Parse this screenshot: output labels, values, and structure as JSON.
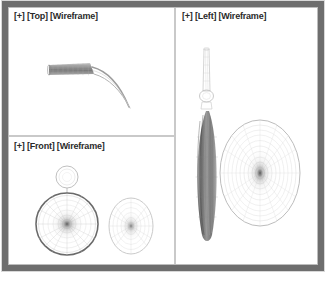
{
  "window": {
    "title": "3D Modeling Viewports",
    "frame_color": "#6e6e6e",
    "background_color": "#ffffff"
  },
  "viewports": [
    {
      "id": "top",
      "label": "[+] [Top] [Wireframe]",
      "label_prefix": "[+]",
      "view_name": "[Top]",
      "shading_mode": "[Wireframe]",
      "objects": "tapered cylinder with curved tail, wireframe"
    },
    {
      "id": "front",
      "label": "[+] [Front] [Wireframe]",
      "label_prefix": "[+]",
      "view_name": "[Front]",
      "shading_mode": "[Wireframe]",
      "objects": "dark radial circle with small circle above, lighter ellipse at right"
    },
    {
      "id": "left",
      "label": "[+] [Left] [Wireframe]",
      "label_prefix": "[+]",
      "view_name": "[Left]",
      "shading_mode": "[Wireframe]",
      "objects": "thin vertical dark disc edge-on with stem, large concentric ellipse at right"
    }
  ],
  "colors": {
    "wireframe_dark": "#4a4a4a",
    "wireframe_mid": "#8e8e8e",
    "wireframe_light": "#c0c0c0",
    "divider": "#c9c9c9",
    "label_text": "#2a2a2a"
  }
}
